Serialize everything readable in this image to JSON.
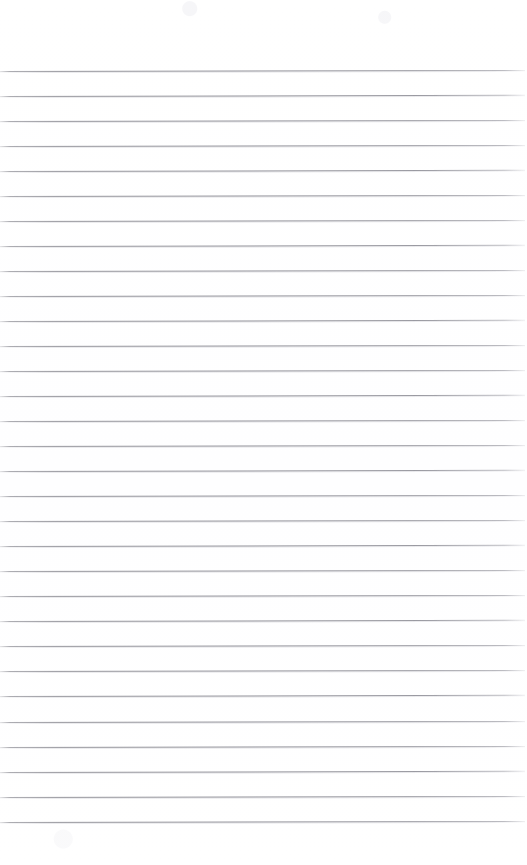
{
  "document": {
    "kind": "lined-paper",
    "title": "",
    "content_text": "",
    "page_width": 527,
    "page_height": 865,
    "background_color": "#ffffff",
    "is_blank": true
  },
  "rules": {
    "count": 31,
    "first_line_y": 71,
    "spacing": 25.05,
    "line_color": "#90909a",
    "line_thickness": 1,
    "left_x": 0,
    "right_x": 525,
    "skew_deg": -0.12,
    "top_margin": 71,
    "bottom_margin": 43,
    "positions_y": [
      71,
      96,
      121,
      146,
      171,
      196,
      221,
      246,
      271,
      296,
      321,
      346,
      371,
      396,
      421,
      446,
      471,
      496,
      521,
      546,
      571,
      596,
      621,
      646,
      671,
      696,
      722,
      747,
      772,
      797,
      822
    ]
  }
}
